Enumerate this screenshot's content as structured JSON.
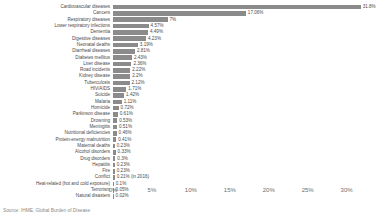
{
  "chart_data": {
    "type": "bar",
    "orientation": "horizontal",
    "title": "",
    "xlabel": "",
    "ylabel": "",
    "xlim": [
      0,
      33
    ],
    "grid": false,
    "legend": false,
    "source": "Source: IHME, Global Burden of Disease",
    "axis_ticks": [
      "0%",
      "5%",
      "10%",
      "15%",
      "20%",
      "25%",
      "30%"
    ],
    "axis_tick_values": [
      0,
      5,
      10,
      15,
      20,
      25,
      30
    ],
    "bar_color": "#8b8b8b",
    "categories": [
      "Cardiovascular diseases",
      "Cancers",
      "Respiratory diseases",
      "Lower respiratory infections",
      "Dementia",
      "Digestive diseases",
      "Neonatal deaths",
      "Diarrheal diseases",
      "Diabetes mellitus",
      "Liver disease",
      "Road incidents",
      "Kidney disease",
      "Tuberculosis",
      "HIV/AIDS",
      "Suicide",
      "Malaria",
      "Homicide",
      "Parkinson disease",
      "Drowning",
      "Meningitis",
      "Nutritional deficiencies",
      "Protein-energy malnutrition",
      "Maternal deaths",
      "Alcohol disorders",
      "Drug disorders",
      "Hepatitis",
      "Fire",
      "Conflict",
      "Heat-related (hot and cold exposure)",
      "Terrorism",
      "Natural disasters"
    ],
    "values": [
      31.8,
      17.06,
      7,
      4.57,
      4.49,
      4.23,
      3.19,
      2.81,
      2.43,
      2.36,
      2.22,
      2.2,
      2.12,
      1.71,
      1.42,
      1.11,
      0.72,
      0.61,
      0.53,
      0.51,
      0.46,
      0.41,
      0.23,
      0.33,
      0.3,
      0.23,
      0.23,
      0.21,
      0.1,
      0.05,
      0.02
    ],
    "value_labels": [
      "31.8%",
      "17.06%",
      "7%",
      "4.57%",
      "4.49%",
      "4.23%",
      "3.19%",
      "2.81%",
      "2.43%",
      "2.36%",
      "2.22%",
      "2.2%",
      "2.12%",
      "1.71%",
      "1.42%",
      "1.11%",
      "0.72%",
      "0.61%",
      "0.53%",
      "0.51%",
      "0.46%",
      "0.41%",
      "0.23%",
      "0.33%",
      "0.3%",
      "0.23%",
      "0.23%",
      "0.21% (in 2016)",
      "0.1%",
      "0.05%",
      "0.02%"
    ]
  }
}
